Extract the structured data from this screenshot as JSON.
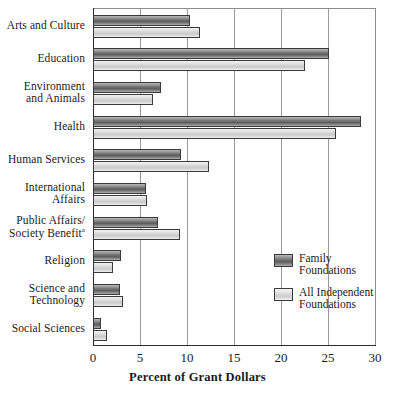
{
  "chart_data": {
    "type": "bar",
    "orientation": "horizontal",
    "title": "",
    "xlabel": "Percent of Grant Dollars",
    "ylabel": "",
    "xlim": [
      0,
      30
    ],
    "xticks": [
      "0",
      "5",
      "10",
      "15",
      "20",
      "25",
      "30"
    ],
    "grid": true,
    "legend_position": "inside-right",
    "categories": [
      "Arts and Culture",
      "Education",
      "Environment and Animals",
      "Health",
      "Human Services",
      "International Affairs",
      "Public Affairs/Society Benefit",
      "Religion",
      "Science and Technology",
      "Social Sciences"
    ],
    "category_lines": [
      [
        "Arts and Culture"
      ],
      [
        "Education"
      ],
      [
        "Environment",
        "and Animals"
      ],
      [
        "Health"
      ],
      [
        "Human Services"
      ],
      [
        "International",
        "Affairs"
      ],
      [
        "Public Affairs/",
        "Society Benefit"
      ],
      [
        "Religion"
      ],
      [
        "Science and",
        "Technology"
      ],
      [
        "Social Sciences"
      ]
    ],
    "footnote_marker": "a",
    "footnote_marker_category": "Public Affairs/Society Benefit",
    "series": [
      {
        "name": "Family Foundations",
        "name_lines": [
          "Family",
          "Foundations"
        ],
        "color": "#6f6f6f",
        "values": [
          10.3,
          25.1,
          7.2,
          28.5,
          9.4,
          5.6,
          6.9,
          3.0,
          2.9,
          0.9
        ]
      },
      {
        "name": "All Independent Foundations",
        "name_lines": [
          "All Independent",
          "Foundations"
        ],
        "color": "#d2d2d2",
        "values": [
          11.4,
          22.6,
          6.4,
          25.8,
          12.3,
          5.7,
          9.3,
          2.1,
          3.2,
          1.5
        ]
      }
    ]
  },
  "axis": {
    "x_title": "Percent of Grant Dollars"
  }
}
